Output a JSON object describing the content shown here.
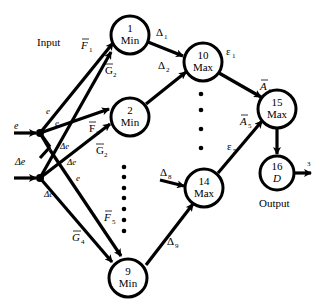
{
  "diagram": {
    "title_labels": {
      "input": "Input",
      "output": "Output"
    },
    "inputs": [
      {
        "id": "e",
        "label": "e"
      },
      {
        "id": "de",
        "label": "Δe"
      }
    ],
    "nodes": [
      {
        "id": "1",
        "num": "1",
        "op": "Min"
      },
      {
        "id": "2",
        "num": "2",
        "op": "Min"
      },
      {
        "id": "9",
        "num": "9",
        "op": "Min"
      },
      {
        "id": "10",
        "num": "10",
        "op": "Max"
      },
      {
        "id": "14",
        "num": "14",
        "op": "Max"
      },
      {
        "id": "15",
        "num": "15",
        "op": "Max"
      },
      {
        "id": "16",
        "num": "16",
        "op": "D"
      }
    ],
    "edge_labels": {
      "e_in": "e",
      "de_in": "Δe",
      "e_to1": "e",
      "e_to2": "e",
      "de_to2": "Δe",
      "de_to1": "Δe",
      "e_to9": "e",
      "de_to9": "Δe",
      "F1": "F",
      "F1_sub": "1",
      "G2a": "G",
      "G2a_sub": "2",
      "F2": "F",
      "F2_sub": "2",
      "G2b": "G",
      "G2b_sub": "2",
      "F5": "F",
      "F5_sub": "5",
      "G4": "G",
      "G4_sub": "4",
      "D1": "Δ",
      "D1_sub": "1",
      "D2": "Δ",
      "D2_sub": "2",
      "D8": "Δ",
      "D8_sub": "8",
      "D9": "Δ",
      "D9_sub": "9",
      "eps1": "ε",
      "eps1_sub": "1",
      "eps5": "ε",
      "eps5_sub": "5",
      "A1": "A",
      "A1_sub": "1",
      "A5": "A",
      "A5_sub": "5",
      "out": "3"
    },
    "edges": [
      {
        "from": "e",
        "to": "1",
        "label": "F̄1"
      },
      {
        "from": "de",
        "to": "1",
        "label": "Ḡ2"
      },
      {
        "from": "e",
        "to": "2",
        "label": "F̄2"
      },
      {
        "from": "de",
        "to": "2",
        "label": "Ḡ2"
      },
      {
        "from": "e",
        "to": "9",
        "label": "F̄5"
      },
      {
        "from": "de",
        "to": "9",
        "label": "Ḡ4"
      },
      {
        "from": "1",
        "to": "10",
        "label": "Δ1"
      },
      {
        "from": "2",
        "to": "10",
        "label": "Δ2"
      },
      {
        "from": "...",
        "to": "14",
        "label": "Δ8"
      },
      {
        "from": "9",
        "to": "14",
        "label": "Δ9"
      },
      {
        "from": "10",
        "to": "15",
        "label": "ε1 / Ā1"
      },
      {
        "from": "14",
        "to": "15",
        "label": "ε5 / Ā5"
      },
      {
        "from": "15",
        "to": "16",
        "label": ""
      },
      {
        "from": "16",
        "to": "out",
        "label": "3"
      }
    ]
  }
}
